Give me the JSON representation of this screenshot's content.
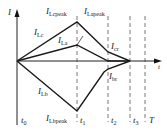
{
  "diagram": {
    "type": "current waveform",
    "axes": {
      "y_label": "I",
      "x_label": "t"
    },
    "time_markers": [
      {
        "id": "t0",
        "label": "t",
        "sub": "0"
      },
      {
        "id": "t1",
        "label": "t",
        "sub": "1"
      },
      {
        "id": "t2",
        "label": "t",
        "sub": "2"
      },
      {
        "id": "t3",
        "label": "t",
        "sub": "3"
      },
      {
        "id": "T",
        "label": "T",
        "sub": ""
      }
    ],
    "curve_labels": {
      "ilcpeak": {
        "label": "I",
        "sub": "Lcpeak"
      },
      "ilapeak": {
        "label": "I",
        "sub": "Lapeak"
      },
      "ilc": {
        "label": "I",
        "sub": "Lc"
      },
      "ila": {
        "label": "I",
        "sub": "La"
      },
      "ilb": {
        "label": "I",
        "sub": "Lb"
      },
      "ilbpeak": {
        "label": "I",
        "sub": "Lbpeak"
      },
      "icr": {
        "label": "I",
        "sub": "cr"
      },
      "ibr": {
        "label": "I",
        "sub": "br"
      }
    },
    "colors": {
      "line": "#1a1a1a",
      "dash": "#555555"
    }
  }
}
